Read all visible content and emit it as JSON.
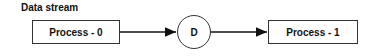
{
  "diagram": {
    "title": "Data stream",
    "nodes": [
      {
        "id": "process-0",
        "label": "Process - 0",
        "shape": "rectangle"
      },
      {
        "id": "d",
        "label": "D",
        "shape": "circle"
      },
      {
        "id": "process-1",
        "label": "Process - 1",
        "shape": "rectangle"
      }
    ],
    "edges": [
      {
        "from": "process-0",
        "to": "d"
      },
      {
        "from": "d",
        "to": "process-1"
      }
    ],
    "colors": {
      "stroke": "#333333",
      "text": "#111111",
      "background": "#ffffff"
    }
  }
}
